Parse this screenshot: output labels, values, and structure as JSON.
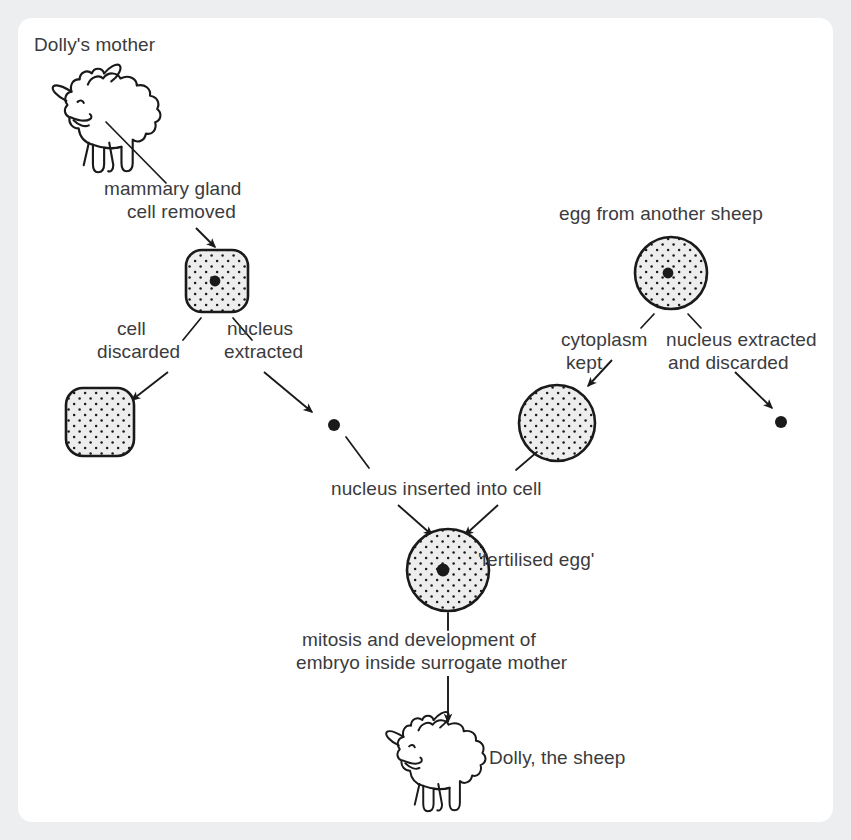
{
  "diagram": {
    "background_color": "#eceef0",
    "card_color": "#ffffff",
    "ink_color": "#1a1a1a",
    "text_color": "#3b3b3d",
    "cell_fill": "#ededed"
  },
  "labels": {
    "dollys_mother": "Dolly's mother",
    "mammary_gland_line1": "mammary gland",
    "mammary_gland_line2": "cell removed",
    "cell_discarded_line1": "cell",
    "cell_discarded_line2": "discarded",
    "nucleus_extracted_line1": "nucleus",
    "nucleus_extracted_line2": "extracted",
    "egg_from_another_sheep": "egg from another sheep",
    "cytoplasm_kept_line1": "cytoplasm",
    "cytoplasm_kept_line2": "kept",
    "nucleus_discarded_line1": "nucleus extracted",
    "nucleus_discarded_line2": "and discarded",
    "nucleus_inserted": "nucleus inserted into cell",
    "fertilised_egg": "'fertilised egg'",
    "mitosis_line1": "mitosis and development of",
    "mitosis_line2": "embryo inside surrogate mother",
    "dolly_the_sheep": "Dolly, the sheep"
  },
  "shapes": {
    "mammary_cell": "rounded-square-cell-with-nucleus",
    "discarded_cell": "rounded-square-cell",
    "donor_egg": "circle-cell-with-nucleus",
    "cytoplasm_cell": "circle-cell",
    "extracted_nucleus": "nucleus-dot",
    "discarded_nucleus": "nucleus-dot",
    "fertilised_egg_cell": "circle-cell-with-nucleus",
    "mother_sheep": "sheep-drawing",
    "dolly_sheep": "sheep-drawing"
  }
}
